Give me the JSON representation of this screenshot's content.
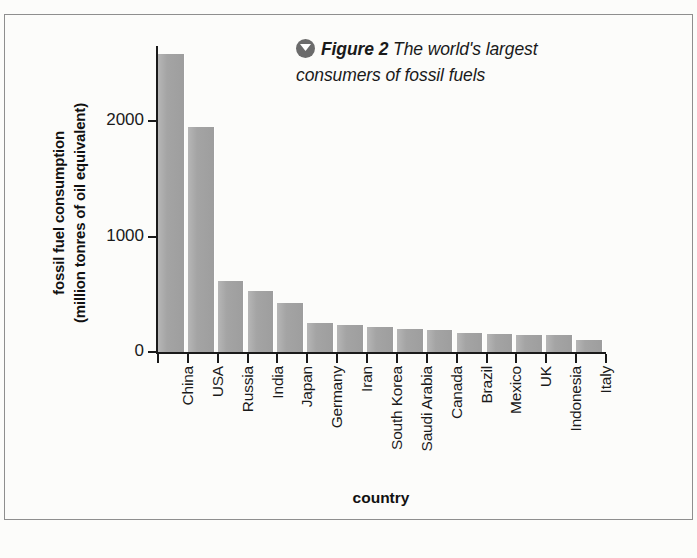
{
  "figure": {
    "badge_icon": "chevron-down-circle-icon",
    "label": "Figure 2",
    "caption_line1": " The world's largest",
    "caption_line2": "consumers of fossil fuels"
  },
  "chart_data": {
    "type": "bar",
    "title": "Figure 2 The world's largest consumers of fossil fuels",
    "xlabel": "country",
    "ylabel": "fossil fuel consumption (million tonres of oil equivalent)",
    "ylabel_line1": "fossil fuel consumption",
    "ylabel_line2": "(million tonres of oil equivalent)",
    "categories": [
      "China",
      "USA",
      "Russia",
      "India",
      "Japan",
      "Germany",
      "Iran",
      "South Korea",
      "Saudi Arabia",
      "Canada",
      "Brazil",
      "Mexico",
      "UK",
      "Indonesia",
      "Italy"
    ],
    "values": [
      2580,
      1950,
      615,
      525,
      425,
      250,
      232,
      215,
      200,
      190,
      165,
      155,
      150,
      145,
      100
    ],
    "ylim": [
      0,
      2650
    ],
    "yticks": [
      0,
      1000,
      2000
    ],
    "ytick_labels": [
      "0",
      "1000",
      "2000"
    ],
    "grid": false,
    "legend": "none",
    "bar_color": "#a6a6a6",
    "axis_color": "#1a1a1a",
    "background": "#fcfcfa"
  }
}
